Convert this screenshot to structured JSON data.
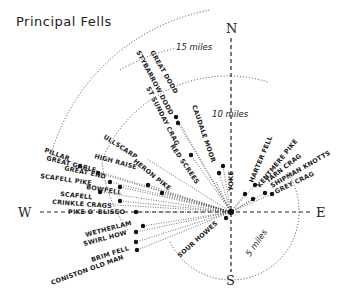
{
  "title": "Principal Fells",
  "compass": {
    "north": "N",
    "south": "S",
    "east": "E",
    "west": "W"
  },
  "rings": [
    {
      "label": "5 miles",
      "r": 68
    },
    {
      "label": "10 miles",
      "r": 136
    },
    {
      "label": "15 miles",
      "r": 204
    }
  ],
  "fells": [
    {
      "name": "GREAT DODD",
      "angle": -60,
      "dist": 110
    },
    {
      "name": "STYBARROW DODD",
      "angle": -62,
      "dist": 104
    },
    {
      "name": "ST SUNDAY CRAG",
      "angle": -63,
      "dist": 92
    },
    {
      "name": "CAUDALE MOOR",
      "angle": -71,
      "dist": 55
    },
    {
      "name": "FAIRFIELD",
      "angle": -60,
      "dist": 82
    },
    {
      "name": "RED SCREES",
      "angle": -56,
      "dist": 67
    },
    {
      "name": "YOKE",
      "angle": -80,
      "dist": 42
    },
    {
      "name": "HARTER FELL",
      "angle": -67,
      "dist": 34
    },
    {
      "name": "KENTMERE PIKE",
      "angle": -51,
      "dist": 28
    },
    {
      "name": "TARN CRAG",
      "angle": -38,
      "dist": 30
    },
    {
      "name": "SHIPMAN KNOTTS",
      "angle": -30,
      "dist": 28
    },
    {
      "name": "GREY CRAG",
      "angle": -26,
      "dist": 43
    },
    {
      "name": "ULLSCARP",
      "angle": -33,
      "dist": 95
    },
    {
      "name": "HERON PIKE",
      "angle": -39,
      "dist": 70
    },
    {
      "name": "HIGH RAISE",
      "angle": -29,
      "dist": 108
    },
    {
      "name": "PILLAR",
      "angle": -19,
      "dist": 167
    },
    {
      "name": "GREAT GABLE",
      "angle": -20,
      "dist": 150
    },
    {
      "name": "GREAT END",
      "angle": -17,
      "dist": 134
    },
    {
      "name": "SCAFELL PIKE",
      "angle": -14,
      "dist": 126
    },
    {
      "name": "BOWFELL",
      "angle": -13,
      "dist": 114
    },
    {
      "name": "SCAFELL",
      "angle": -10,
      "dist": 122
    },
    {
      "name": "CRINKLE CRAGS",
      "angle": -7,
      "dist": 112
    },
    {
      "name": "PIKE O' BLISCO",
      "angle": -3,
      "dist": 99
    },
    {
      "name": "WETHERLAM",
      "angle": 9,
      "dist": 123
    },
    {
      "name": "SWIRL HOW",
      "angle": 11,
      "dist": 133
    },
    {
      "name": "BRIM FELL",
      "angle": 16,
      "dist": 131
    },
    {
      "name": "CONISTON OLD MAN",
      "angle": 20,
      "dist": 132
    },
    {
      "name": "SOUR HOWES",
      "angle": 40,
      "dist": 18
    }
  ]
}
